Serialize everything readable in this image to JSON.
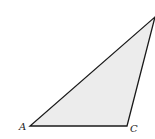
{
  "diagram": {
    "type": "triangle",
    "fill_color": "#ececec",
    "stroke_color": "#1a1a1a",
    "vertices": {
      "A": {
        "x": 30,
        "y": 126,
        "label": "A"
      },
      "C": {
        "x": 127,
        "y": 126,
        "label": "C"
      },
      "B": {
        "x": 155,
        "y": 17,
        "label": ""
      }
    }
  }
}
